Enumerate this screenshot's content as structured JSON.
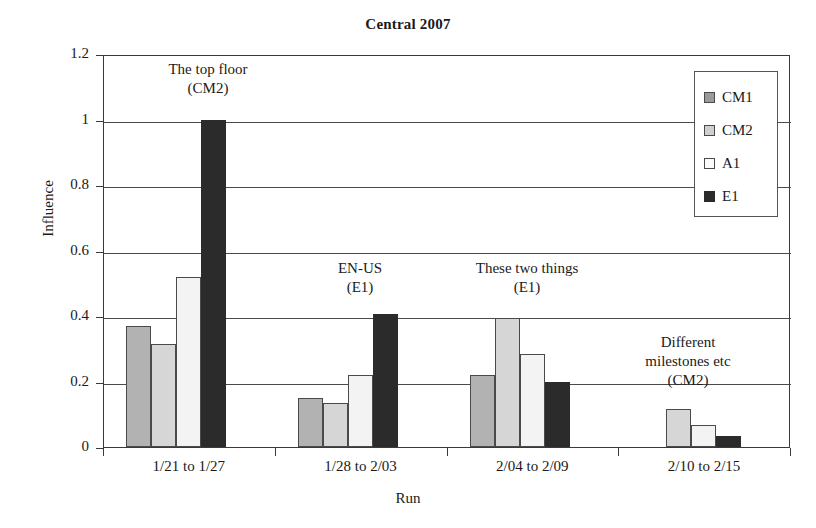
{
  "chart_data": {
    "type": "bar",
    "title": "Central 2007",
    "xlabel": "Run",
    "ylabel": "Influence",
    "ylim": [
      0,
      1.2
    ],
    "ytick_labels": [
      "0",
      "0.2",
      "0.4",
      "0.6",
      "0.8",
      "1",
      "1.2"
    ],
    "ytick_values": [
      0,
      0.2,
      0.4,
      0.6,
      0.8,
      1,
      1.2
    ],
    "grid": true,
    "legend_position": "top-right",
    "categories": [
      "1/21 to 1/27",
      "1/28 to 2/03",
      "2/04 to 2/09",
      "2/10 to 2/15"
    ],
    "series": [
      {
        "name": "CM1",
        "color": "#b2b2b2",
        "values": [
          0.37,
          0.15,
          0.22,
          0.0
        ]
      },
      {
        "name": "CM2",
        "color": "#d6d6d6",
        "values": [
          0.315,
          0.135,
          0.395,
          0.115
        ]
      },
      {
        "name": "A1",
        "color": "#f3f3f3",
        "values": [
          0.52,
          0.22,
          0.285,
          0.068
        ]
      },
      {
        "name": "E1",
        "color": "#2b2b2b",
        "values": [
          1.0,
          0.405,
          0.2,
          0.035
        ]
      }
    ],
    "annotations": [
      {
        "line1": "The top floor",
        "line2": "(CM2)"
      },
      {
        "line1": "EN-US",
        "line2": "(E1)"
      },
      {
        "line1": "These two things",
        "line2": "(E1)"
      },
      {
        "line1": "Different",
        "line2": "milestones etc",
        "line3": "(CM2)"
      }
    ]
  },
  "legend": {
    "items": [
      {
        "label": "CM1"
      },
      {
        "label": "CM2"
      },
      {
        "label": "A1"
      },
      {
        "label": "E1"
      }
    ]
  }
}
